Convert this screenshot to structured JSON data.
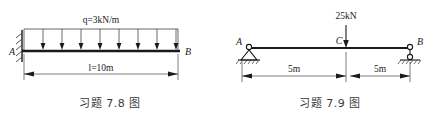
{
  "figures": [
    {
      "id": "figure-7-8",
      "caption": "习题 7.8 图",
      "beam": {
        "left_node": "A",
        "right_node": "B",
        "support_left": "fixed-wall-support",
        "support_right": "free-end"
      },
      "load": {
        "type": "uniformly-distributed",
        "symbol": "q",
        "equals": "=",
        "magnitude": "3kN/m",
        "full_label": "q=3kN/m",
        "arrow_count": 8,
        "direction": "down"
      },
      "dimension": {
        "symbol": "l",
        "equals": "=",
        "value": "10m",
        "full_label": "l=10m"
      }
    },
    {
      "id": "figure-7-9",
      "caption": "习题 7.9 图",
      "beam": {
        "left_node": "A",
        "mid_node": "C",
        "right_node": "B",
        "support_left": "pin-support",
        "support_right": "roller-support"
      },
      "load": {
        "type": "concentrated-point-load",
        "magnitude": "25kN",
        "applied_at": "C",
        "direction": "down"
      },
      "dimensions": [
        {
          "value": "5m",
          "from": "A",
          "to": "C"
        },
        {
          "value": "5m",
          "from": "C",
          "to": "B"
        }
      ]
    }
  ],
  "style": {
    "line_color": "#1a1a1a",
    "thin_line_color": "#444444",
    "background": "#ffffff"
  }
}
